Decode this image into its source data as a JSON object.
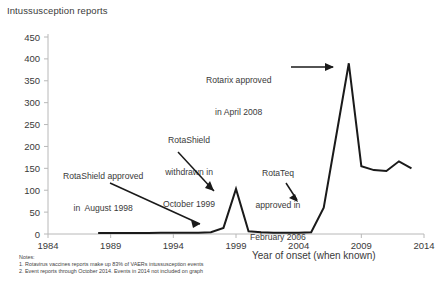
{
  "chart_data": {
    "type": "line",
    "title": "Intussusception reports",
    "xlabel": "Year of onset (when known)",
    "ylabel": "",
    "xlim": [
      1984,
      2014
    ],
    "ylim": [
      0,
      450
    ],
    "grid": false,
    "legend": "none",
    "x_ticks": [
      "1984",
      "1989",
      "1994",
      "1999",
      "2004",
      "2009",
      "2014"
    ],
    "y_ticks": [
      "0",
      "50",
      "100",
      "150",
      "200",
      "250",
      "300",
      "350",
      "400",
      "450"
    ],
    "x": [
      1988,
      1989,
      1990,
      1991,
      1992,
      1993,
      1994,
      1995,
      1996,
      1997,
      1998,
      1999,
      2000,
      2001,
      2002,
      2003,
      2004,
      2005,
      2006,
      2007,
      2008,
      2009,
      2010,
      2011,
      2012,
      2013
    ],
    "values": [
      2,
      2,
      2,
      2,
      2,
      3,
      3,
      3,
      3,
      4,
      14,
      103,
      6,
      4,
      3,
      3,
      3,
      4,
      60,
      225,
      390,
      155,
      146,
      144,
      166,
      150
    ],
    "series": [
      {
        "name": "Intussusception reports",
        "values": [
          2,
          2,
          2,
          2,
          2,
          3,
          3,
          3,
          3,
          4,
          14,
          103,
          6,
          4,
          3,
          3,
          3,
          4,
          60,
          225,
          390,
          155,
          146,
          144,
          166,
          150
        ]
      }
    ],
    "annotations": [
      {
        "id": "rotashield-approved",
        "lines": [
          "RotaShield approved",
          "in  August 1998"
        ],
        "points_to_year": 1998,
        "points_to_value": 14
      },
      {
        "id": "rotashield-withdrawn",
        "lines": [
          "RotaShield",
          "withdrawn in",
          "October 1999"
        ],
        "points_to_year": 1999,
        "points_to_value": 103
      },
      {
        "id": "rotarix-approved",
        "lines": [
          "Rotarix approved",
          "in April 2008"
        ],
        "points_to_year": 2008,
        "points_to_value": 390
      },
      {
        "id": "rotateq-approved",
        "lines": [
          "RotaTeq",
          "approved in",
          "February 2006"
        ],
        "points_to_year": 2006,
        "points_to_value": 60
      }
    ]
  },
  "notes": {
    "heading": "Notes:",
    "items": [
      "1. Rotavirus vaccines reports make up 83% of VAERs intussusception events",
      "2. Event reports through October 2014.  Events in 2014 not included on graph"
    ]
  },
  "colors": {
    "line": "#1a1a1a",
    "axis": "#b8b8b8",
    "text": "#3a3a3a",
    "background": "#ffffff"
  }
}
